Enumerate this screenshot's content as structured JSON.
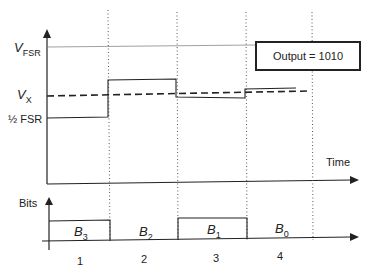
{
  "diagram": {
    "y_labels": {
      "vfsr_main": "V",
      "vfsr_sub": "FSR",
      "vx_main": "V",
      "vx_sub": "X",
      "half_fsr": "½ FSR"
    },
    "time_label": "Time",
    "bits_label": "Bits",
    "output_box": "Output = 1010",
    "bits": [
      {
        "main": "B",
        "sub": "3",
        "value": 1
      },
      {
        "main": "B",
        "sub": "2",
        "value": 0
      },
      {
        "main": "B",
        "sub": "1",
        "value": 1
      },
      {
        "main": "B",
        "sub": "0",
        "value": 0
      }
    ],
    "steps": [
      "1",
      "2",
      "3",
      "4"
    ],
    "colors": {
      "line": "#222222",
      "dotted": "#555555"
    }
  }
}
